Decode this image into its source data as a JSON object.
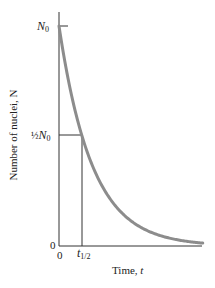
{
  "chart_data": {
    "type": "line",
    "title": "",
    "xlabel": "Time, t",
    "ylabel": "Number of nuclei, N",
    "x_ticks": [
      "0",
      "t1/2"
    ],
    "y_ticks": [
      "0",
      "1/2 N0",
      "N0"
    ],
    "series": [
      {
        "name": "N(t) = N0 e^(-λt)",
        "color": "#8c8c8c",
        "x_in_halflives": [
          0,
          0.5,
          1,
          1.5,
          2,
          3,
          4,
          5,
          6
        ],
        "y_fraction_of_N0": [
          1.0,
          0.707,
          0.5,
          0.354,
          0.25,
          0.125,
          0.0625,
          0.031,
          0.016
        ]
      }
    ],
    "annotations": [
      {
        "type": "guide-line",
        "from": "y=1/2 N0",
        "to": "x=t1/2"
      }
    ],
    "xlim": [
      0,
      6
    ],
    "ylim": [
      0,
      1.05
    ],
    "grid": false,
    "legend": "none"
  },
  "labels": {
    "y_axis": "Number of nuclei, N",
    "x_axis_text": "Time, ",
    "x_axis_var": "t",
    "n0_main": "N",
    "n0_sub": "0",
    "half_frac": "½",
    "half_n": "N",
    "half_sub": "0",
    "zero_y": "0",
    "zero_x": "0",
    "thalf_main": "t",
    "thalf_sub": "1/2"
  }
}
